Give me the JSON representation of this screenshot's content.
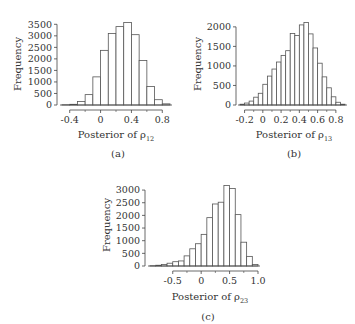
{
  "chart_data": [
    {
      "type": "bar",
      "panel": "(a)",
      "title": "",
      "xlabel": "Posterior of ρ12",
      "xlabel_main": "Posterior of ρ",
      "xlabel_sub": "12",
      "ylabel": "Frequency",
      "xticks": [
        -0.4,
        0,
        0.4,
        0.8
      ],
      "xtick_labels": [
        "-0.4",
        "0",
        "0.4",
        "0.8"
      ],
      "yticks": [
        0,
        500,
        1000,
        1500,
        2000,
        2500,
        3000,
        3500
      ],
      "ytick_labels": [
        "0",
        "500",
        "1000",
        "1500",
        "2000",
        "2500",
        "3000",
        "3500"
      ],
      "xlim": [
        -0.5,
        0.9
      ],
      "ylim": [
        0,
        3600
      ],
      "grid": false,
      "bin_width": 0.1,
      "bin_edges": [
        -0.5,
        -0.4,
        -0.3,
        -0.2,
        -0.1,
        0.0,
        0.1,
        0.2,
        0.3,
        0.4,
        0.5,
        0.6,
        0.7,
        0.8,
        0.9
      ],
      "values": [
        10,
        30,
        150,
        450,
        1220,
        2370,
        3100,
        3400,
        3580,
        3050,
        1930,
        800,
        230,
        50
      ]
    },
    {
      "type": "bar",
      "panel": "(b)",
      "title": "",
      "xlabel": "Posterior of ρ13",
      "xlabel_main": "Posterior of ρ",
      "xlabel_sub": "13",
      "ylabel": "Frequency",
      "xticks": [
        -0.2,
        0,
        0.2,
        0.4,
        0.6,
        0.8
      ],
      "xtick_labels": [
        "-0.2",
        "0",
        "0.2",
        "0.4",
        "0.6",
        "0.8"
      ],
      "yticks": [
        0,
        500,
        1000,
        1500,
        2000
      ],
      "ytick_labels": [
        "0",
        "500",
        "1000",
        "1500",
        "2000"
      ],
      "xlim": [
        -0.25,
        0.9
      ],
      "ylim": [
        0,
        2150
      ],
      "grid": false,
      "bin_width": 0.05,
      "bin_edges": [
        -0.25,
        -0.2,
        -0.15,
        -0.1,
        -0.05,
        0.0,
        0.05,
        0.1,
        0.15,
        0.2,
        0.25,
        0.3,
        0.35,
        0.4,
        0.45,
        0.5,
        0.55,
        0.6,
        0.65,
        0.7,
        0.75,
        0.8,
        0.85,
        0.9
      ],
      "values": [
        20,
        50,
        100,
        200,
        300,
        530,
        740,
        920,
        1100,
        1270,
        1390,
        1830,
        1780,
        2050,
        2110,
        1820,
        1460,
        1070,
        720,
        440,
        210,
        70,
        20
      ]
    },
    {
      "type": "bar",
      "panel": "(c)",
      "title": "",
      "xlabel": "Posterior of ρ23",
      "xlabel_main": "Posterior of ρ",
      "xlabel_sub": "23",
      "ylabel": "Frequency",
      "xticks": [
        -0.5,
        0,
        0.5,
        1.0
      ],
      "xtick_labels": [
        "-0.5",
        "0",
        "0.5",
        "1.0"
      ],
      "yticks": [
        0,
        500,
        1000,
        1500,
        2000,
        2500,
        3000
      ],
      "ytick_labels": [
        "0",
        "500",
        "1000",
        "1500",
        "2000",
        "2500",
        "3000"
      ],
      "xlim": [
        -0.9,
        1.0
      ],
      "ylim": [
        0,
        3200
      ],
      "grid": false,
      "bin_width": 0.1,
      "bin_edges": [
        -0.9,
        -0.8,
        -0.7,
        -0.6,
        -0.5,
        -0.4,
        -0.3,
        -0.2,
        -0.1,
        0.0,
        0.1,
        0.2,
        0.3,
        0.4,
        0.5,
        0.6,
        0.7,
        0.8,
        0.9,
        1.0
      ],
      "values": [
        10,
        30,
        60,
        110,
        170,
        200,
        400,
        680,
        880,
        1250,
        1910,
        2450,
        2520,
        3180,
        3060,
        2030,
        940,
        380,
        60
      ]
    }
  ],
  "panels": [
    {
      "label": "(a)",
      "ylabel": "Frequency",
      "xlabel_main": "Posterior of ρ",
      "xlabel_sub": "12"
    },
    {
      "label": "(b)",
      "ylabel": "Frequency",
      "xlabel_main": "Posterior of ρ",
      "xlabel_sub": "13"
    },
    {
      "label": "(c)",
      "ylabel": "Frequency",
      "xlabel_main": "Posterior of ρ",
      "xlabel_sub": "23"
    }
  ],
  "colors": {
    "bar_fill": "#ffffff",
    "bar_stroke": "#555555",
    "axis": "#444444",
    "text": "#333333"
  }
}
